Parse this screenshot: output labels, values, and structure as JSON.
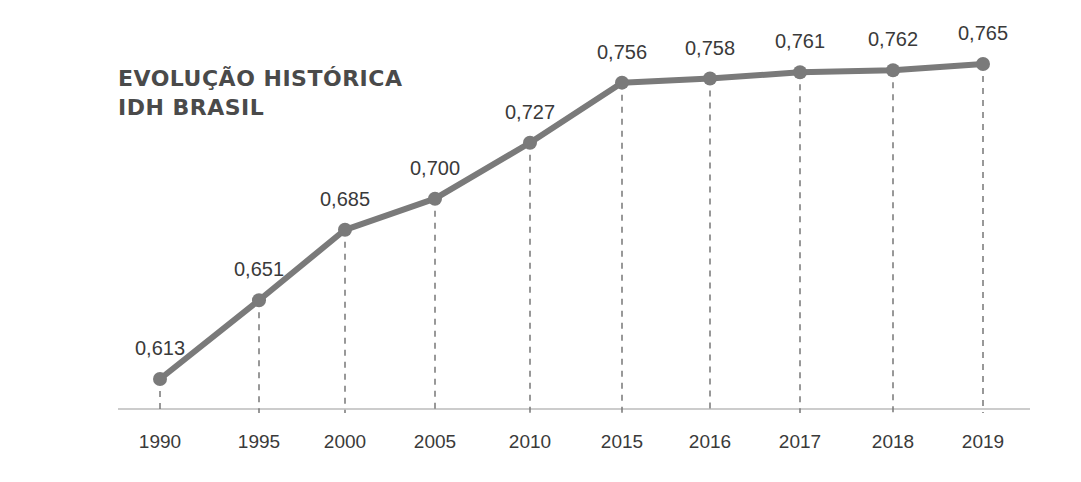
{
  "title": {
    "line1": "EVOLUÇÃO HISTÓRICA",
    "line2": "IDH BRASIL"
  },
  "colors": {
    "line": "#7a7a7a",
    "text": "#3a3a3a",
    "title": "#4a4a4a",
    "axis": "#bbbbbb",
    "dash": "#777777"
  },
  "chart_data": {
    "type": "line",
    "title": "EVOLUÇÃO HISTÓRICA IDH BRASIL",
    "xlabel": "",
    "ylabel": "",
    "categories": [
      "1990",
      "1995",
      "2000",
      "2005",
      "2010",
      "2015",
      "2016",
      "2017",
      "2018",
      "2019"
    ],
    "values": [
      0.613,
      0.651,
      0.685,
      0.7,
      0.727,
      0.756,
      0.758,
      0.761,
      0.762,
      0.765
    ],
    "value_labels": [
      "0,613",
      "0,651",
      "0,685",
      "0,700",
      "0,727",
      "0,756",
      "0,758",
      "0,761",
      "0,762",
      "0,765"
    ],
    "grid": false,
    "drop_lines": "dashed",
    "legend": "none"
  }
}
